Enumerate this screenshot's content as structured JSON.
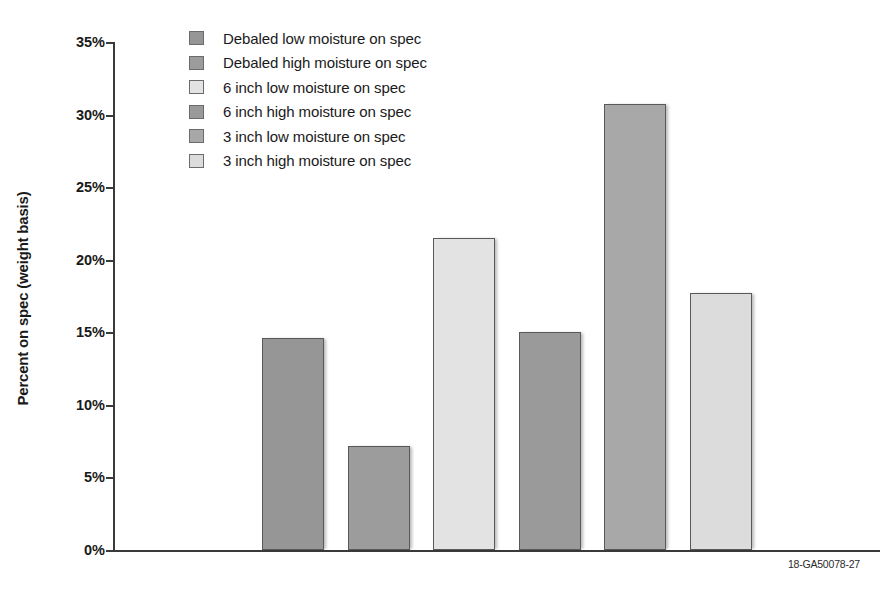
{
  "caption": "18-GA50078-27",
  "axis": {
    "y_title": "Percent on spec (weight basis)",
    "ticks": [
      "0%",
      "5%",
      "10%",
      "15%",
      "20%",
      "25%",
      "30%",
      "35%"
    ]
  },
  "legend": {
    "items": [
      {
        "label": "Debaled low moisture on spec",
        "color": "#969696"
      },
      {
        "label": "Debaled high moisture on spec",
        "color": "#9c9c9c"
      },
      {
        "label": "6 inch low moisture on spec",
        "color": "#e3e3e3"
      },
      {
        "label": "6 inch high moisture on spec",
        "color": "#9a9a9a"
      },
      {
        "label": "3 inch low moisture on spec",
        "color": "#a8a8a8"
      },
      {
        "label": "3 inch high moisture on spec",
        "color": "#dcdcdc"
      }
    ]
  },
  "chart_data": {
    "type": "bar",
    "title": "",
    "xlabel": "",
    "ylabel": "Percent on spec (weight basis)",
    "ylim": [
      0,
      35
    ],
    "ytick_values": [
      0,
      5,
      10,
      15,
      20,
      25,
      30,
      35
    ],
    "ytick_labels": [
      "0%",
      "5%",
      "10%",
      "15%",
      "20%",
      "25%",
      "30%",
      "35%"
    ],
    "grid": false,
    "legend_position": "upper-left-inside",
    "categories": [
      "Debaled low moisture on spec",
      "Debaled high moisture on spec",
      "6 inch low moisture on spec",
      "6 inch high moisture on spec",
      "3 inch low moisture on spec",
      "3 inch high moisture on spec"
    ],
    "values": [
      14.6,
      7.2,
      21.5,
      15.0,
      30.7,
      17.7
    ],
    "colors": [
      "#969696",
      "#9c9c9c",
      "#e3e3e3",
      "#9a9a9a",
      "#a8a8a8",
      "#dcdcdc"
    ]
  }
}
